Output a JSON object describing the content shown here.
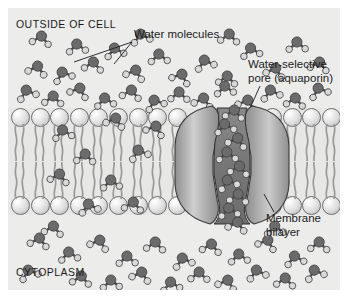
{
  "figure": {
    "labels": {
      "outside": "OUTSIDE OF CELL",
      "cytoplasm": "CYTOPLASM",
      "water_molecules": "Water molecules",
      "pore_line1": "Water-selective",
      "pore_line2": "pore (aquaporin)",
      "membrane_line1": "Membrane",
      "membrane_line2": "bilayer"
    },
    "colors": {
      "background": "#ffffff",
      "panel": "#f2f2f0",
      "fluid": "#ececeb",
      "membrane_band": "#e7e7e5",
      "lipid_head": "#dedede",
      "lipid_outline": "#6e6e6e",
      "protein_light": "#b9b9b9",
      "protein_dark": "#6f6f6f",
      "pore_lumen": "#7c7c7c",
      "oxygen": "#6b6b6b",
      "hydrogen": "#d9d9d9",
      "text": "#1b1b1b"
    },
    "geometry": {
      "lipid_columns_left": 9,
      "lipid_columns_right": 4,
      "leaflets": 2,
      "membrane_top_y": 100,
      "membrane_bottom_y": 207
    },
    "water_top": [
      {
        "x": 58,
        "y": 30,
        "r": -6
      },
      {
        "x": 18,
        "y": 52,
        "r": 14
      },
      {
        "x": 44,
        "y": 58,
        "r": -20
      },
      {
        "x": 74,
        "y": 48,
        "r": 8
      },
      {
        "x": 96,
        "y": 34,
        "r": -12
      },
      {
        "x": 116,
        "y": 56,
        "r": 18
      },
      {
        "x": 140,
        "y": 40,
        "r": -4
      },
      {
        "x": 162,
        "y": 60,
        "r": 22
      },
      {
        "x": 186,
        "y": 46,
        "r": -16
      },
      {
        "x": 208,
        "y": 62,
        "r": 6
      },
      {
        "x": 232,
        "y": 34,
        "r": -10
      },
      {
        "x": 256,
        "y": 54,
        "r": 16
      },
      {
        "x": 278,
        "y": 28,
        "r": -2
      },
      {
        "x": 300,
        "y": 48,
        "r": 12
      },
      {
        "x": 8,
        "y": 76,
        "r": -18
      },
      {
        "x": 34,
        "y": 82,
        "r": 4
      },
      {
        "x": 60,
        "y": 74,
        "r": 20
      },
      {
        "x": 86,
        "y": 84,
        "r": -8
      },
      {
        "x": 112,
        "y": 76,
        "r": 10
      },
      {
        "x": 136,
        "y": 86,
        "r": -22
      },
      {
        "x": 160,
        "y": 78,
        "r": 2
      },
      {
        "x": 184,
        "y": 84,
        "r": 14
      },
      {
        "x": 206,
        "y": 72,
        "r": -6
      },
      {
        "x": 228,
        "y": 86,
        "r": 18
      },
      {
        "x": 252,
        "y": 76,
        "r": -14
      },
      {
        "x": 276,
        "y": 84,
        "r": 8
      },
      {
        "x": 300,
        "y": 74,
        "r": -20
      },
      {
        "x": 22,
        "y": 22,
        "r": 10
      },
      {
        "x": 122,
        "y": 20,
        "r": -14
      },
      {
        "x": 210,
        "y": 20,
        "r": 6
      }
    ],
    "water_membrane": [
      {
        "x": 44,
        "y": 116,
        "r": -10
      },
      {
        "x": 96,
        "y": 104,
        "r": 16
      },
      {
        "x": 66,
        "y": 140,
        "r": 4
      },
      {
        "x": 120,
        "y": 136,
        "r": -18
      },
      {
        "x": 40,
        "y": 160,
        "r": 12
      },
      {
        "x": 92,
        "y": 166,
        "r": -6
      },
      {
        "x": 136,
        "y": 112,
        "r": 20
      },
      {
        "x": 70,
        "y": 190,
        "r": -14
      },
      {
        "x": 114,
        "y": 188,
        "r": 8
      }
    ],
    "water_pore": [
      {
        "x": 215,
        "y": 96,
        "r": 8
      },
      {
        "x": 206,
        "y": 110,
        "r": -12
      },
      {
        "x": 218,
        "y": 124,
        "r": 16
      },
      {
        "x": 208,
        "y": 138,
        "r": -4
      },
      {
        "x": 220,
        "y": 152,
        "r": 10
      },
      {
        "x": 209,
        "y": 166,
        "r": -18
      },
      {
        "x": 219,
        "y": 180,
        "r": 6
      },
      {
        "x": 210,
        "y": 194,
        "r": -8
      },
      {
        "x": 218,
        "y": 208,
        "r": 14
      }
    ],
    "water_bottom": [
      {
        "x": 20,
        "y": 224,
        "r": 12
      },
      {
        "x": 50,
        "y": 238,
        "r": -8
      },
      {
        "x": 80,
        "y": 226,
        "r": 18
      },
      {
        "x": 108,
        "y": 242,
        "r": -2
      },
      {
        "x": 136,
        "y": 228,
        "r": 6
      },
      {
        "x": 164,
        "y": 244,
        "r": -16
      },
      {
        "x": 192,
        "y": 230,
        "r": 10
      },
      {
        "x": 220,
        "y": 240,
        "r": -6
      },
      {
        "x": 248,
        "y": 226,
        "r": 20
      },
      {
        "x": 276,
        "y": 242,
        "r": -12
      },
      {
        "x": 300,
        "y": 228,
        "r": 4
      },
      {
        "x": 10,
        "y": 256,
        "r": -20
      },
      {
        "x": 62,
        "y": 262,
        "r": 8
      },
      {
        "x": 92,
        "y": 266,
        "r": -4
      },
      {
        "x": 122,
        "y": 258,
        "r": 16
      },
      {
        "x": 152,
        "y": 268,
        "r": -10
      },
      {
        "x": 180,
        "y": 258,
        "r": 2
      },
      {
        "x": 208,
        "y": 266,
        "r": 18
      },
      {
        "x": 238,
        "y": 256,
        "r": -14
      },
      {
        "x": 266,
        "y": 264,
        "r": 6
      },
      {
        "x": 296,
        "y": 256,
        "r": -18
      },
      {
        "x": 34,
        "y": 212,
        "r": 10
      },
      {
        "x": 256,
        "y": 212,
        "r": -6
      }
    ]
  }
}
